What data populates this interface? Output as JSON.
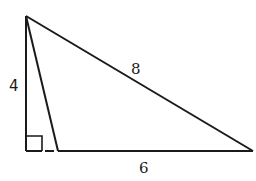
{
  "diagram": {
    "type": "triangle",
    "labels": {
      "altitude": "4",
      "hypotenuse_side": "8",
      "base": "6"
    },
    "stroke_color": "#1a1a1a",
    "background": "#ffffff"
  }
}
